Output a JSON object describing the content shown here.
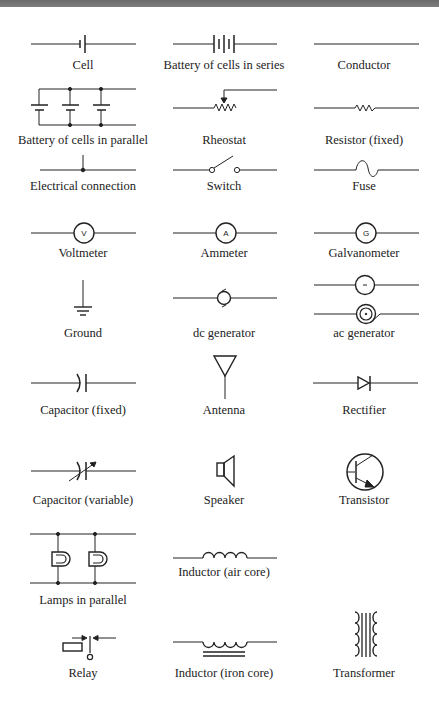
{
  "header": {
    "banner_color": "#727272"
  },
  "symbols": [
    {
      "label": "Cell",
      "icon": "cell-icon"
    },
    {
      "label": "Battery of cells in series",
      "icon": "battery-series-icon"
    },
    {
      "label": "Conductor",
      "icon": "conductor-icon"
    },
    {
      "label": "Battery of cells in parallel",
      "icon": "battery-parallel-icon"
    },
    {
      "label": "Rheostat",
      "icon": "rheostat-icon"
    },
    {
      "label": "Resistor (fixed)",
      "icon": "resistor-icon"
    },
    {
      "label": "Electrical connection",
      "icon": "connection-icon"
    },
    {
      "label": "Switch",
      "icon": "switch-icon"
    },
    {
      "label": "Fuse",
      "icon": "fuse-icon"
    },
    {
      "label": "Voltmeter",
      "icon": "voltmeter-icon",
      "glyph": "V"
    },
    {
      "label": "Ammeter",
      "icon": "ammeter-icon",
      "glyph": "A"
    },
    {
      "label": "Galvanometer",
      "icon": "galvanometer-icon",
      "glyph": "G"
    },
    {
      "label": "Ground",
      "icon": "ground-icon"
    },
    {
      "label": "dc generator",
      "icon": "dc-generator-icon"
    },
    {
      "label": "ac generator",
      "icon": "ac-generator-icon",
      "glyph": "~"
    },
    {
      "label": "Capacitor (fixed)",
      "icon": "capacitor-fixed-icon"
    },
    {
      "label": "Antenna",
      "icon": "antenna-icon"
    },
    {
      "label": "Rectifier",
      "icon": "rectifier-icon"
    },
    {
      "label": "Capacitor (variable)",
      "icon": "capacitor-variable-icon"
    },
    {
      "label": "Speaker",
      "icon": "speaker-icon"
    },
    {
      "label": "Transistor",
      "icon": "transistor-icon"
    },
    {
      "label": "Lamps in parallel",
      "icon": "lamps-parallel-icon"
    },
    {
      "label": "Inductor (air core)",
      "icon": "inductor-air-icon"
    },
    {
      "label": "Relay",
      "icon": "relay-icon"
    },
    {
      "label": "Inductor (iron core)",
      "icon": "inductor-iron-icon"
    },
    {
      "label": "Transformer",
      "icon": "transformer-icon"
    }
  ]
}
